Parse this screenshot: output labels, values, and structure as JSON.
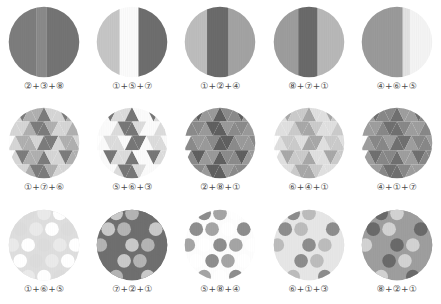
{
  "figure": {
    "kind": "pattern-sample-grid",
    "rows": 3,
    "columns": 5,
    "background": "#ffffff",
    "label_color": "#4a4a4a"
  },
  "palette": {
    "p1": "#ffffff",
    "p2": "#e8e8e8",
    "p3": "#d0d0d0",
    "p4": "#b6b6b6",
    "p5": "#9c9c9c",
    "p6": "#868686",
    "p7": "#6e6e6e",
    "p8": "#585858"
  },
  "cells": [
    {
      "id": "cell-1-1",
      "row": 1,
      "col": 1,
      "pattern": "vertical-stripes",
      "label": "②+③+⑧",
      "codes": [
        2,
        3,
        8
      ],
      "colors": [
        "#7d7d7d",
        "#8a8a8a",
        "#747474"
      ],
      "bands": [
        {
          "x": 0,
          "w": 40,
          "color": "#7d7d7d"
        },
        {
          "x": 40,
          "w": 14,
          "color": "#8a8a8a"
        },
        {
          "x": 54,
          "w": 46,
          "color": "#747474"
        }
      ]
    },
    {
      "id": "cell-1-2",
      "row": 1,
      "col": 2,
      "pattern": "vertical-stripes",
      "label": "①+⑤+⑦",
      "codes": [
        1,
        5,
        7
      ],
      "colors": [
        "#c8c8c8",
        "#fbfbfb",
        "#6e6e6e"
      ],
      "bands": [
        {
          "x": 0,
          "w": 33,
          "color": "#c6c6c6"
        },
        {
          "x": 33,
          "w": 26,
          "color": "#fbfbfb"
        },
        {
          "x": 59,
          "w": 41,
          "color": "#6e6e6e"
        }
      ]
    },
    {
      "id": "cell-1-3",
      "row": 1,
      "col": 3,
      "pattern": "vertical-stripes",
      "label": "①+②+④",
      "codes": [
        1,
        2,
        4
      ],
      "colors": [
        "#bdbdbd",
        "#6b6b6b",
        "#a3a3a3"
      ],
      "bands": [
        {
          "x": 0,
          "w": 32,
          "color": "#bdbdbd"
        },
        {
          "x": 32,
          "w": 30,
          "color": "#6b6b6b"
        },
        {
          "x": 62,
          "w": 38,
          "color": "#a3a3a3"
        }
      ]
    },
    {
      "id": "cell-1-4",
      "row": 1,
      "col": 4,
      "pattern": "vertical-stripes",
      "label": "⑧+⑦+①",
      "codes": [
        8,
        7,
        1
      ],
      "colors": [
        "#9d9d9d",
        "#6a6a6a",
        "#b8b8b8"
      ],
      "bands": [
        {
          "x": 0,
          "w": 35,
          "color": "#9d9d9d"
        },
        {
          "x": 35,
          "w": 27,
          "color": "#6a6a6a"
        },
        {
          "x": 62,
          "w": 38,
          "color": "#b8b8b8"
        }
      ]
    },
    {
      "id": "cell-1-5",
      "row": 1,
      "col": 5,
      "pattern": "vertical-stripes",
      "label": "④+⑥+⑤",
      "codes": [
        4,
        6,
        5
      ],
      "colors": [
        "#9a9a9a",
        "#e2e2e2",
        "#f1f1f1"
      ],
      "bands": [
        {
          "x": 0,
          "w": 58,
          "color": "#9a9a9a"
        },
        {
          "x": 58,
          "w": 10,
          "color": "#e2e2e2"
        },
        {
          "x": 68,
          "w": 32,
          "color": "#f4f4f4"
        }
      ]
    },
    {
      "id": "cell-2-1",
      "row": 2,
      "col": 1,
      "pattern": "triangles",
      "label": "①+⑦+⑥",
      "codes": [
        1,
        7,
        6
      ],
      "colors": [
        "#d6d6d6",
        "#7c7c7c",
        "#b0b0b0"
      ]
    },
    {
      "id": "cell-2-2",
      "row": 2,
      "col": 2,
      "pattern": "triangles",
      "label": "⑤+⑥+③",
      "codes": [
        5,
        6,
        3
      ],
      "colors": [
        "#fbfbfb",
        "#777777",
        "#dcdcdc"
      ]
    },
    {
      "id": "cell-2-3",
      "row": 2,
      "col": 3,
      "pattern": "triangles",
      "label": "②+⑧+①",
      "codes": [
        2,
        8,
        1
      ],
      "colors": [
        "#8b8b8b",
        "#606060",
        "#9a9a9a"
      ]
    },
    {
      "id": "cell-2-4",
      "row": 2,
      "col": 4,
      "pattern": "triangles",
      "label": "⑥+④+①",
      "codes": [
        6,
        4,
        1
      ],
      "colors": [
        "#e0e0e0",
        "#a8a8a8",
        "#cbcbcb"
      ]
    },
    {
      "id": "cell-2-5",
      "row": 2,
      "col": 5,
      "pattern": "triangles",
      "label": "④+①+⑦",
      "codes": [
        4,
        1,
        7
      ],
      "colors": [
        "#9e9e9e",
        "#707070",
        "#888888"
      ]
    },
    {
      "id": "cell-3-1",
      "row": 3,
      "col": 1,
      "pattern": "dots",
      "label": "①+⑥+⑤",
      "codes": [
        1,
        6,
        5
      ],
      "colors": [
        "#ffffff",
        "#dcdcdc",
        "#eaeaea"
      ],
      "background": "#ffffff",
      "dot_color": "#f6f6f6",
      "field_color": "#dedede"
    },
    {
      "id": "cell-3-2",
      "row": 3,
      "col": 2,
      "pattern": "dots",
      "label": "⑦+②+①",
      "codes": [
        7,
        2,
        1
      ],
      "colors": [
        "#6f6f6f",
        "#c9c9c9",
        "#b4b4b4"
      ],
      "background": "#6f6f6f",
      "dot_color": "#c9c9c9",
      "field_color": "#6f6f6f"
    },
    {
      "id": "cell-3-3",
      "row": 3,
      "col": 3,
      "pattern": "dots",
      "label": "⑤+⑧+④",
      "codes": [
        5,
        8,
        4
      ],
      "colors": [
        "#ffffff",
        "#8e8e8e",
        "#a5a5a5"
      ],
      "background": "#ffffff",
      "dot_color": "#8e8e8e",
      "field_color": "#fdfdfd"
    },
    {
      "id": "cell-3-4",
      "row": 3,
      "col": 4,
      "pattern": "dots",
      "label": "⑥+①+③",
      "codes": [
        6,
        1,
        3
      ],
      "colors": [
        "#e6e6e6",
        "#8d8d8d",
        "#bcbcbc"
      ],
      "background": "#e6e6e6",
      "dot_color": "#8d8d8d",
      "field_color": "#e6e6e6"
    },
    {
      "id": "cell-3-5",
      "row": 3,
      "col": 5,
      "pattern": "dots",
      "label": "⑧+②+①",
      "codes": [
        8,
        2,
        1
      ],
      "colors": [
        "#9e9e9e",
        "#6a6a6a",
        "#d2d2d2"
      ],
      "background": "#9e9e9e",
      "dot_color": "#6a6a6a",
      "field_color": "#9e9e9e"
    }
  ]
}
